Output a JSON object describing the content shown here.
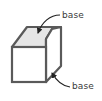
{
  "diagram": {
    "title": "",
    "labels": {
      "top_base": "base",
      "bottom_base": "base"
    },
    "colors": {
      "stroke": "#5a5a5a",
      "top_face_fill": "#e6e6e6",
      "face_fill": "#ffffff",
      "arrow": "#222222",
      "label_text": "#3a3a3a"
    }
  }
}
